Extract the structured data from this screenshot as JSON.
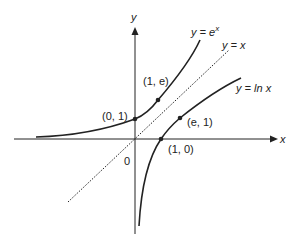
{
  "figure": {
    "axes": {
      "x_label": "x",
      "y_label": "y",
      "origin_label": "0"
    },
    "curves": [
      {
        "name": "exp",
        "label": "y = e^x",
        "label_main": "y = e",
        "label_sup": "x"
      },
      {
        "name": "identity",
        "label": "y = x",
        "style": "dotted"
      },
      {
        "name": "ln",
        "label": "y = ln x"
      }
    ],
    "points": [
      {
        "label": "(0, 1)"
      },
      {
        "label": "(1, e)"
      },
      {
        "label": "(e, 1)"
      },
      {
        "label": "(1, 0)"
      }
    ],
    "colors": {
      "ink": "#222222",
      "background": "#ffffff"
    }
  }
}
